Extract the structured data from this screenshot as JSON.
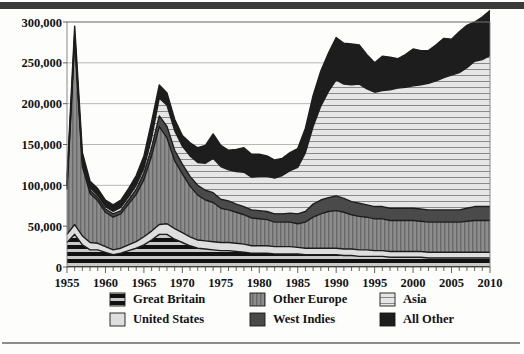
{
  "chart_data": {
    "type": "area",
    "stacked": true,
    "title": "",
    "subtitle": "",
    "xlabel": "",
    "ylabel": "",
    "xlim": [
      1955,
      2010
    ],
    "ylim": [
      0,
      300000
    ],
    "ytick_step": 50000,
    "xtick_step": 1,
    "grid": true,
    "legend_position": "bottom",
    "y_ticks": [
      "0",
      "50,000",
      "100,000",
      "150,000",
      "200,000",
      "250,000",
      "300,000"
    ],
    "y_tick_values": [
      0,
      50000,
      100000,
      150000,
      200000,
      250000,
      300000
    ],
    "x_ticks": [
      "1955",
      "1960",
      "1965",
      "1970",
      "1975",
      "1980",
      "1985",
      "1990",
      "1995",
      "2000",
      "2005",
      "2010"
    ],
    "x_tick_values": [
      1955,
      1960,
      1965,
      1970,
      1975,
      1980,
      1985,
      1990,
      1995,
      2000,
      2005,
      2010
    ],
    "x": [
      1955,
      1956,
      1957,
      1958,
      1959,
      1960,
      1961,
      1962,
      1963,
      1964,
      1965,
      1966,
      1967,
      1968,
      1969,
      1970,
      1971,
      1972,
      1973,
      1974,
      1975,
      1976,
      1977,
      1978,
      1979,
      1980,
      1981,
      1982,
      1983,
      1984,
      1985,
      1986,
      1987,
      1988,
      1989,
      1990,
      1991,
      1992,
      1993,
      1994,
      1995,
      1996,
      1997,
      1998,
      1999,
      2000,
      2001,
      2002,
      2003,
      2004,
      2005,
      2006,
      2007,
      2008,
      2009,
      2010
    ],
    "series": [
      {
        "name": "Great Britain",
        "pattern": "horizontal-stripe-dark",
        "color": "#1b1b1b",
        "values": [
          30000,
          40000,
          27000,
          21000,
          21000,
          18000,
          15000,
          17000,
          20000,
          23000,
          27000,
          33000,
          40000,
          40000,
          34000,
          30000,
          26000,
          23000,
          22000,
          21000,
          20000,
          20000,
          19000,
          18000,
          17000,
          17000,
          17000,
          16000,
          16000,
          16000,
          16000,
          15000,
          15000,
          15000,
          15000,
          15000,
          14000,
          14000,
          13000,
          13000,
          13000,
          13000,
          12000,
          12000,
          12000,
          12000,
          12000,
          11000,
          11000,
          11000,
          11000,
          11000,
          11000,
          11000,
          11000,
          11000
        ]
      },
      {
        "name": "United States",
        "pattern": "solid-light",
        "color": "#dcdcdc",
        "values": [
          10000,
          12000,
          11000,
          9000,
          8000,
          7000,
          6000,
          6000,
          7000,
          8000,
          10000,
          11000,
          12000,
          13000,
          13000,
          12000,
          11000,
          10000,
          10000,
          10000,
          10000,
          10000,
          10000,
          10000,
          9000,
          9000,
          9000,
          9000,
          9000,
          9000,
          8000,
          8000,
          8000,
          8000,
          8000,
          8000,
          8000,
          8000,
          8000,
          8000,
          7000,
          7000,
          7000,
          7000,
          7000,
          7000,
          7000,
          7000,
          7000,
          7000,
          7000,
          7000,
          7000,
          7000,
          7000,
          7000
        ]
      },
      {
        "name": "Other Europe",
        "pattern": "vertical-stripe-gray",
        "color": "#8e8e8e",
        "values": [
          55000,
          225000,
          85000,
          60000,
          52000,
          42000,
          40000,
          42000,
          50000,
          58000,
          70000,
          92000,
          120000,
          105000,
          83000,
          72000,
          62000,
          55000,
          50000,
          48000,
          42000,
          40000,
          38000,
          36000,
          34000,
          33000,
          32000,
          30000,
          30000,
          30000,
          29000,
          32000,
          38000,
          42000,
          45000,
          46000,
          45000,
          42000,
          41000,
          40000,
          39000,
          39000,
          38000,
          38000,
          38000,
          38000,
          37000,
          37000,
          37000,
          37000,
          37000,
          37000,
          38000,
          39000,
          39000,
          39000
        ]
      },
      {
        "name": "West Indies",
        "pattern": "solid-dark-gray",
        "color": "#4a4a4a",
        "values": [
          4000,
          5000,
          5000,
          4000,
          4000,
          4000,
          4000,
          4000,
          5000,
          6000,
          8000,
          10000,
          13000,
          14000,
          13000,
          12000,
          12000,
          12000,
          12000,
          12000,
          11000,
          11000,
          10000,
          10000,
          10000,
          10000,
          10000,
          10000,
          10000,
          11000,
          12000,
          13000,
          16000,
          17000,
          17000,
          18000,
          17000,
          16000,
          16000,
          15000,
          15000,
          15000,
          15000,
          15000,
          15000,
          15000,
          15000,
          15000,
          15000,
          15000,
          15000,
          15000,
          16000,
          17000,
          17000,
          17000
        ]
      },
      {
        "name": "Asia",
        "pattern": "horizontal-stripe-light",
        "color": "#e0e0e0",
        "values": [
          3000,
          3000,
          3000,
          3000,
          3000,
          3000,
          3000,
          4000,
          4000,
          5000,
          6000,
          12000,
          22000,
          26000,
          24000,
          22000,
          25000,
          28000,
          33000,
          42000,
          40000,
          38000,
          40000,
          42000,
          40000,
          42000,
          43000,
          44000,
          47000,
          52000,
          57000,
          72000,
          95000,
          115000,
          130000,
          142000,
          140000,
          143000,
          146000,
          142000,
          140000,
          142000,
          145000,
          147000,
          148000,
          150000,
          152000,
          155000,
          158000,
          162000,
          165000,
          168000,
          172000,
          178000,
          180000,
          185000
        ]
      },
      {
        "name": "All Other",
        "pattern": "solid-black",
        "color": "#1d1d1d",
        "values": [
          8000,
          10000,
          9000,
          8000,
          8000,
          8000,
          8000,
          9000,
          10000,
          12000,
          15000,
          20000,
          16000,
          15000,
          14000,
          13000,
          16000,
          18000,
          22000,
          30000,
          26000,
          24000,
          27000,
          30000,
          28000,
          27000,
          25000,
          22000,
          21000,
          22000,
          23000,
          30000,
          38000,
          43000,
          47000,
          52000,
          50000,
          50000,
          48000,
          42000,
          36000,
          42000,
          40000,
          36000,
          40000,
          45000,
          42000,
          40000,
          44000,
          48000,
          44000,
          50000,
          52000,
          48000,
          52000,
          55000
        ]
      }
    ]
  },
  "legend": {
    "items": [
      {
        "label": "Great Britain",
        "pattern": "horizontal-stripe-dark"
      },
      {
        "label": "Other Europe",
        "pattern": "vertical-stripe-gray"
      },
      {
        "label": "Asia",
        "pattern": "horizontal-stripe-light"
      },
      {
        "label": "United States",
        "pattern": "solid-light"
      },
      {
        "label": "West Indies",
        "pattern": "solid-dark-gray"
      },
      {
        "label": "All Other",
        "pattern": "solid-black"
      }
    ]
  },
  "colors": {
    "great_britain": "#1b1b1b",
    "united_states": "#dcdcdc",
    "other_europe": "#8e8e8e",
    "west_indies": "#4a4a4a",
    "asia": "#e0e0e0",
    "all_other": "#1d1d1d",
    "grid": "#9a9a9a",
    "axis": "#6f6f6f",
    "text": "#131313",
    "rule": "#3a3a3a"
  }
}
